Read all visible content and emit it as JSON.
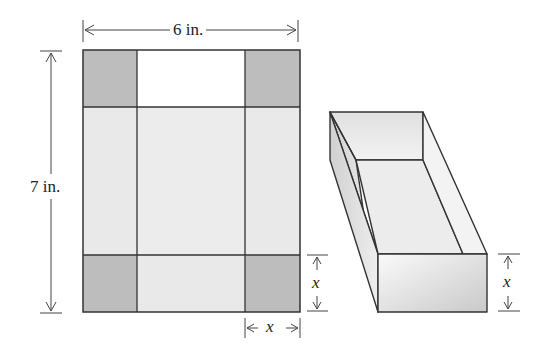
{
  "diagram": {
    "type": "box net and folded open box",
    "net": {
      "width_label": "6 in.",
      "height_label": "7 in.",
      "corner_cut_label_vertical": "x",
      "corner_cut_label_horizontal": "x"
    },
    "box": {
      "height_label": "x"
    },
    "colors": {
      "corner_shade": "#b8b8b8",
      "panel_light": "#e6e6e6",
      "panel_white": "#fafafa",
      "line": "#333333"
    }
  }
}
